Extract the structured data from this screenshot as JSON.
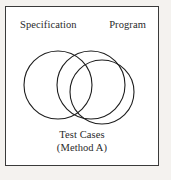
{
  "figure": {
    "frame_border_color": "#3a3a3a",
    "background_color": "#ffffff",
    "page_background_color": "#f4f2ef",
    "stroke_color": "#1d1d1d",
    "labels": {
      "specification": "Specification",
      "program": "Program"
    },
    "caption": {
      "line1": "Test Cases",
      "line2": "(Method A)"
    },
    "diagram": {
      "type": "venn",
      "set_count": 3,
      "circles": [
        {
          "name": "specification-circle",
          "cx": 52,
          "cy": 78,
          "r": 34
        },
        {
          "name": "program-circle",
          "cx": 85,
          "cy": 78,
          "r": 34
        },
        {
          "name": "test-cases-circle",
          "cx": 96,
          "cy": 85,
          "r": 32
        }
      ]
    }
  }
}
